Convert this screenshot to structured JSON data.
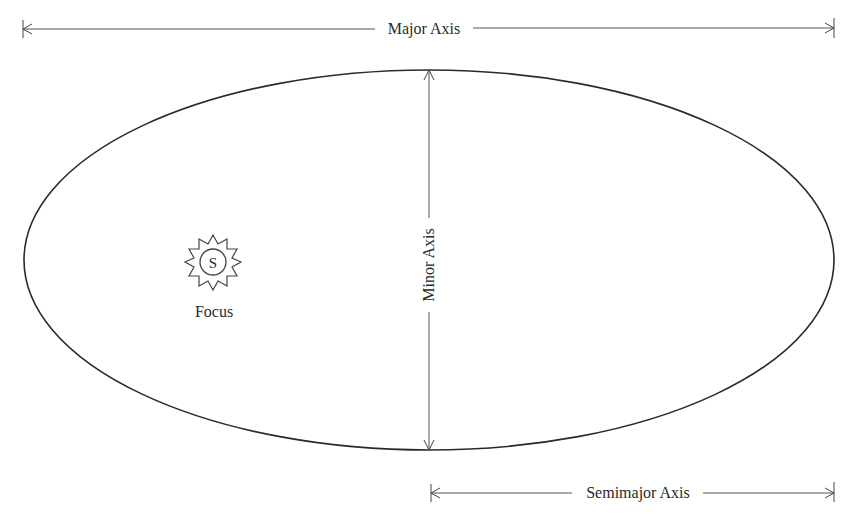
{
  "diagram": {
    "labels": {
      "major_axis": "Major Axis",
      "minor_axis": "Minor Axis",
      "semimajor_axis": "Semimajor Axis",
      "focus": "Focus",
      "sun_symbol": "S"
    },
    "colors": {
      "stroke": "#2a2a2a",
      "dimension_line": "#555555",
      "background": "#ffffff"
    },
    "ellipse": {
      "cx": 429,
      "cy": 260,
      "rx": 405,
      "ry": 190
    }
  }
}
